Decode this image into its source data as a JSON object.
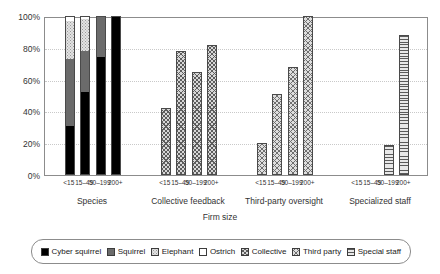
{
  "chart_data": {
    "type": "bar",
    "title": "",
    "subtitle": "",
    "xlabel": "Firm size",
    "ylabel": "",
    "ylim": [
      0,
      100
    ],
    "ytick_labels": [
      "0%",
      "20%",
      "40%",
      "60%",
      "80%",
      "100%"
    ],
    "ytick_values": [
      0,
      20,
      40,
      60,
      80,
      100
    ],
    "grid": true,
    "legend_position": "bottom",
    "group_labels": [
      "Species",
      "Collective feedback",
      "Third-party oversight",
      "Specialized staff"
    ],
    "categories": [
      "<15",
      "15–49",
      "50–199",
      "200+"
    ],
    "legend": [
      {
        "label": "Cyber squirrel",
        "fill": "f-cyber",
        "color": "#000000"
      },
      {
        "label": "Squirrel",
        "fill": "f-squirrel",
        "color": "#6b6b6b"
      },
      {
        "label": "Elephant",
        "fill": "f-elephant",
        "color": "#e3e3e3"
      },
      {
        "label": "Ostrich",
        "fill": "f-ostrich",
        "color": "#ffffff"
      },
      {
        "label": "Collective",
        "fill": "f-collective",
        "color": "#d7d7d7"
      },
      {
        "label": "Third party",
        "fill": "f-thirdparty",
        "color": "#dedede"
      },
      {
        "label": "Special staff",
        "fill": "f-special",
        "color": "#e8e8e8"
      }
    ],
    "groups": [
      {
        "name": "Species",
        "stacked": true,
        "series": [
          {
            "name": "Cyber squirrel",
            "fill": "f-cyber",
            "values": [
              31,
              52,
              74,
              100
            ]
          },
          {
            "name": "Squirrel",
            "fill": "f-squirrel",
            "values": [
              42,
              26,
              26,
              0
            ]
          },
          {
            "name": "Elephant",
            "fill": "f-elephant",
            "values": [
              24,
              20,
              0,
              0
            ]
          },
          {
            "name": "Ostrich",
            "fill": "f-ostrich",
            "values": [
              3,
              2,
              0,
              0
            ]
          }
        ]
      },
      {
        "name": "Collective feedback",
        "stacked": false,
        "series": [
          {
            "name": "Collective",
            "fill": "f-collective",
            "values": [
              42,
              78,
              65,
              82
            ]
          }
        ]
      },
      {
        "name": "Third-party oversight",
        "stacked": false,
        "series": [
          {
            "name": "Third party",
            "fill": "f-thirdparty",
            "values": [
              20,
              51,
              68,
              100
            ]
          }
        ]
      },
      {
        "name": "Specialized staff",
        "stacked": false,
        "series": [
          {
            "name": "Special staff",
            "fill": "f-special",
            "values": [
              0,
              0,
              19,
              88
            ]
          }
        ]
      }
    ]
  }
}
